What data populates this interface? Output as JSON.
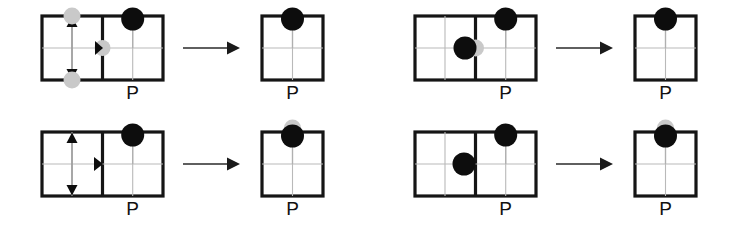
{
  "figure": {
    "width": 753,
    "height": 229,
    "background": "#ffffff",
    "type": "diagram",
    "colors": {
      "frame_stroke": "#151515",
      "grid_stroke": "#b9b9b9",
      "token_black": "#0d0d0d",
      "token_gray": "#c9c9c9",
      "arrow": "#1a1a1a",
      "label_text": "#111111"
    }
  },
  "panels": [
    {
      "id": "panel-top-left",
      "position": "top-left",
      "source": {
        "cells": 2,
        "label": "P",
        "label_cell": "right",
        "annotations": [
          {
            "kind": "double-arrow",
            "orientation": "vertical",
            "cell": "left",
            "has_end_markers": true,
            "marker_color": "#c9c9c9"
          },
          {
            "kind": "arrowhead",
            "orientation": "right",
            "at": "divider-midpoint",
            "has_marker": true,
            "marker_color": "#c9c9c9"
          }
        ],
        "tokens": [
          {
            "color": "black",
            "cell": "right",
            "anchor": "top-edge"
          }
        ]
      },
      "arrow": {
        "direction": "right"
      },
      "result": {
        "cells": 1,
        "label": "P",
        "tokens": [
          {
            "color": "black",
            "anchor": "top-edge"
          }
        ]
      }
    },
    {
      "id": "panel-top-right",
      "position": "top-right",
      "source": {
        "cells": 2,
        "label": "P",
        "label_cell": "right",
        "annotations": [],
        "tokens": [
          {
            "color": "black",
            "cell": "left",
            "anchor": "divider-midpoint-left"
          },
          {
            "color": "gray",
            "cell": "left",
            "anchor": "divider-midpoint"
          },
          {
            "color": "black",
            "cell": "right",
            "anchor": "top-edge"
          }
        ]
      },
      "arrow": {
        "direction": "right"
      },
      "result": {
        "cells": 1,
        "label": "P",
        "tokens": [
          {
            "color": "black",
            "anchor": "top-edge"
          }
        ]
      }
    },
    {
      "id": "panel-bottom-left",
      "position": "bottom-left",
      "source": {
        "cells": 2,
        "label": "P",
        "label_cell": "right",
        "annotations": [
          {
            "kind": "double-arrow",
            "orientation": "vertical",
            "cell": "left",
            "has_end_markers": false
          },
          {
            "kind": "arrowhead",
            "orientation": "right",
            "at": "divider-midpoint",
            "has_marker": false
          }
        ],
        "tokens": [
          {
            "color": "black",
            "cell": "right",
            "anchor": "top-edge"
          }
        ]
      },
      "arrow": {
        "direction": "right"
      },
      "result": {
        "cells": 1,
        "label": "P",
        "tokens": [
          {
            "color": "black",
            "anchor": "top-edge"
          },
          {
            "color": "gray",
            "anchor": "above-top-edge"
          }
        ]
      }
    },
    {
      "id": "panel-bottom-right",
      "position": "bottom-right",
      "source": {
        "cells": 2,
        "label": "P",
        "label_cell": "right",
        "annotations": [],
        "tokens": [
          {
            "color": "black",
            "cell": "left",
            "anchor": "divider-midpoint-left"
          },
          {
            "color": "black",
            "cell": "right",
            "anchor": "top-edge"
          }
        ]
      },
      "arrow": {
        "direction": "right"
      },
      "result": {
        "cells": 1,
        "label": "P",
        "tokens": [
          {
            "color": "black",
            "anchor": "top-edge"
          },
          {
            "color": "gray",
            "anchor": "above-top-edge"
          }
        ]
      }
    }
  ],
  "labels": {
    "p": "P"
  }
}
